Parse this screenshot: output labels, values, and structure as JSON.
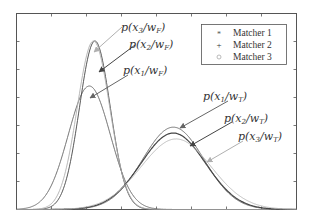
{
  "chart_data": {
    "type": "line",
    "title": "",
    "xlabel": "",
    "ylabel": "",
    "grid": false,
    "legend_position": "upper-right",
    "legend": [
      {
        "label": "Matcher 1",
        "marker": "*",
        "color": "#555555"
      },
      {
        "label": "Matcher 2",
        "marker": "+",
        "color": "#333333"
      },
      {
        "label": "Matcher 3",
        "marker": "o",
        "color": "#aaaaaa"
      }
    ],
    "x_ticks_count": 7,
    "y_ticks_count": 6,
    "series": [
      {
        "name": "p(x1/wF)",
        "matcher": 1,
        "class": "F",
        "mean": 0.26,
        "peak": 0.63,
        "std": 0.075,
        "color": "#666666"
      },
      {
        "name": "p(x2/wF)",
        "matcher": 2,
        "class": "F",
        "mean": 0.28,
        "peak": 0.86,
        "std": 0.055,
        "color": "#444444"
      },
      {
        "name": "p(x3/wF)",
        "matcher": 3,
        "class": "F",
        "mean": 0.275,
        "peak": 0.86,
        "std": 0.058,
        "color": "#b0b0b0"
      },
      {
        "name": "p(x1/wT)",
        "matcher": 1,
        "class": "T",
        "mean": 0.56,
        "peak": 0.42,
        "std": 0.11,
        "color": "#666666"
      },
      {
        "name": "p(x2/wT)",
        "matcher": 2,
        "class": "T",
        "mean": 0.56,
        "peak": 0.39,
        "std": 0.115,
        "color": "#444444"
      },
      {
        "name": "p(x3/wT)",
        "matcher": 3,
        "class": "T",
        "mean": 0.57,
        "peak": 0.36,
        "std": 0.125,
        "color": "#b8b8b8"
      }
    ],
    "annotations": [
      {
        "text_base": "p(x",
        "sub1": "3",
        "mid": "/w",
        "sub2": "F",
        "end": ")",
        "color": "#b0b0b0"
      },
      {
        "text_base": "p(x",
        "sub1": "2",
        "mid": "/w",
        "sub2": "F",
        "end": ")",
        "color": "#444444"
      },
      {
        "text_base": "p(x",
        "sub1": "1",
        "mid": "/w",
        "sub2": "F",
        "end": ")",
        "color": "#666666"
      },
      {
        "text_base": "p(x",
        "sub1": "1",
        "mid": "/w",
        "sub2": "T",
        "end": ")",
        "color": "#666666"
      },
      {
        "text_base": "p(x",
        "sub1": "2",
        "mid": "/w",
        "sub2": "T",
        "end": ")",
        "color": "#444444"
      },
      {
        "text_base": "p(x",
        "sub1": "3",
        "mid": "/w",
        "sub2": "T",
        "end": ")",
        "color": "#b0b0b0"
      }
    ]
  },
  "legend": {
    "items": [
      "Matcher 1",
      "Matcher 2",
      "Matcher 3"
    ]
  },
  "labels": {
    "f3": {
      "p": "p(x",
      "s1": "3",
      "m": "/w",
      "s2": "F",
      "e": ")"
    },
    "f2": {
      "p": "p(x",
      "s1": "2",
      "m": "/w",
      "s2": "F",
      "e": ")"
    },
    "f1": {
      "p": "p(x",
      "s1": "1",
      "m": "/w",
      "s2": "F",
      "e": ")"
    },
    "t1": {
      "p": "p(x",
      "s1": "1",
      "m": "/w",
      "s2": "T",
      "e": ")"
    },
    "t2": {
      "p": "p(x",
      "s1": "2",
      "m": "/w",
      "s2": "T",
      "e": ")"
    },
    "t3": {
      "p": "p(x",
      "s1": "3",
      "m": "/w",
      "s2": "T",
      "e": ")"
    }
  }
}
